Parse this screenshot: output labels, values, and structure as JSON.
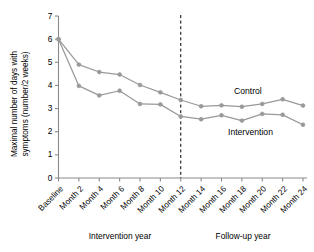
{
  "chart_data": {
    "type": "line",
    "title": "",
    "xlabel": "",
    "ylabel": "Maximal number of days with symptoms (number/2 weeks)",
    "ylabel_line1": "Maximal number of days with",
    "ylabel_line2": "symptoms (number/2 weeks)",
    "ylim": [
      0,
      7
    ],
    "yticks": [
      0,
      1,
      2,
      3,
      4,
      5,
      6,
      7
    ],
    "ytick_labels": [
      "0",
      "1",
      "2",
      "3",
      "4",
      "5",
      "6",
      "7"
    ],
    "grid": false,
    "legend_position": "inline-right",
    "categories": [
      "Baseline",
      "Month 2",
      "Month 4",
      "Month 6",
      "Month 8",
      "Month 10",
      "Month 12",
      "Month 14",
      "Month 16",
      "Month 18",
      "Month 20",
      "Month 22",
      "Month 24"
    ],
    "series": [
      {
        "name": "Control",
        "color": "#999999",
        "values": [
          6.0,
          4.9,
          4.58,
          4.47,
          4.02,
          3.7,
          3.37,
          3.1,
          3.14,
          3.08,
          3.2,
          3.4,
          3.13
        ]
      },
      {
        "name": "Intervention",
        "color": "#999999",
        "values": [
          6.0,
          3.98,
          3.57,
          3.77,
          3.2,
          3.18,
          2.66,
          2.54,
          2.71,
          2.48,
          2.77,
          2.73,
          2.3
        ]
      }
    ],
    "annotations": [
      {
        "name": "divider",
        "type": "vline",
        "x_category": "Month 12",
        "style": "dashed",
        "color": "#000000"
      }
    ],
    "period_labels": [
      {
        "label": "Intervention year",
        "from": "Baseline",
        "to": "Month 12"
      },
      {
        "label": "Follow-up year",
        "from": "Month 12",
        "to": "Month 24"
      }
    ]
  }
}
